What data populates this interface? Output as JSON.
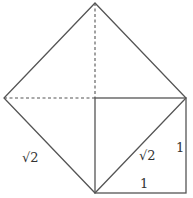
{
  "diagram": {
    "stroke_color": "#555555",
    "labels": {
      "sqrt2_left": "√2",
      "sqrt2_diagonal": "√2",
      "side_right": "1",
      "side_bottom": "1"
    },
    "points": {
      "top": [
        95,
        3
      ],
      "left": [
        4,
        98
      ],
      "right": [
        186,
        98
      ],
      "bottom": [
        95,
        193
      ],
      "center": [
        95,
        98
      ],
      "corner": [
        186,
        193
      ]
    }
  }
}
